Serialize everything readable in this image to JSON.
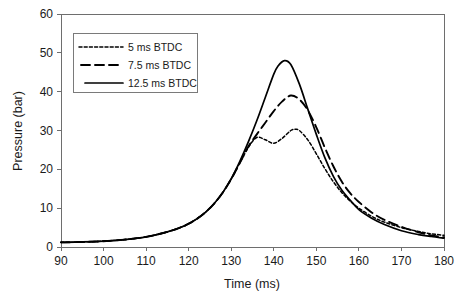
{
  "chart_data": {
    "type": "line",
    "title": "",
    "xlabel": "Time (ms)",
    "ylabel": "Pressure (bar)",
    "xlim": [
      90,
      180
    ],
    "ylim": [
      0,
      60
    ],
    "xticks": [
      90,
      100,
      110,
      120,
      130,
      140,
      150,
      160,
      170,
      180
    ],
    "yticks": [
      0,
      10,
      20,
      30,
      40,
      50,
      60
    ],
    "grid": false,
    "legend_position": "upper-left",
    "series": [
      {
        "name": "5 ms BTDC",
        "style": "dotted",
        "color": "#000000",
        "x": [
          90,
          95,
          100,
          105,
          110,
          115,
          118,
          120,
          122,
          124,
          126,
          128,
          130,
          132,
          134,
          136,
          138,
          140,
          142,
          144,
          145,
          146,
          148,
          150,
          152,
          154,
          156,
          158,
          160,
          163,
          166,
          170,
          174,
          177,
          180
        ],
        "y": [
          1.2,
          1.3,
          1.5,
          1.9,
          2.6,
          3.9,
          5.0,
          6.0,
          7.3,
          9.0,
          11.2,
          14.0,
          17.5,
          21.6,
          25.6,
          28.2,
          27.6,
          26.7,
          28.0,
          30.0,
          30.3,
          30.0,
          27.6,
          24.0,
          20.2,
          16.8,
          14.0,
          11.8,
          10.0,
          7.9,
          6.4,
          5.0,
          4.0,
          3.4,
          3.0
        ]
      },
      {
        "name": "7.5 ms BTDC",
        "style": "dashed",
        "color": "#000000",
        "x": [
          90,
          95,
          100,
          105,
          110,
          115,
          118,
          120,
          122,
          124,
          126,
          128,
          130,
          132,
          134,
          136,
          138,
          140,
          142,
          144,
          146,
          148,
          150,
          152,
          154,
          156,
          158,
          160,
          163,
          166,
          170,
          174,
          177,
          180
        ],
        "y": [
          1.2,
          1.3,
          1.5,
          1.9,
          2.6,
          3.9,
          5.0,
          6.0,
          7.3,
          9.0,
          11.2,
          14.0,
          17.5,
          21.6,
          25.8,
          29.0,
          32.0,
          35.0,
          37.5,
          39.0,
          38.0,
          35.2,
          30.8,
          25.6,
          20.8,
          16.8,
          13.8,
          11.6,
          8.9,
          7.0,
          5.2,
          3.8,
          3.0,
          2.5
        ]
      },
      {
        "name": "12.5 ms BTDC",
        "style": "solid",
        "color": "#000000",
        "x": [
          90,
          95,
          100,
          105,
          110,
          115,
          118,
          120,
          122,
          124,
          126,
          128,
          130,
          132,
          134,
          136,
          138,
          140,
          141,
          142.5,
          144,
          146,
          148,
          150,
          152,
          154,
          156,
          158,
          160,
          163,
          166,
          170,
          174,
          177,
          180
        ],
        "y": [
          1.2,
          1.3,
          1.5,
          1.9,
          2.6,
          3.9,
          5.0,
          6.0,
          7.3,
          9.0,
          11.2,
          14.0,
          17.6,
          22.0,
          27.0,
          32.5,
          38.5,
          44.5,
          46.6,
          48.0,
          47.0,
          42.0,
          35.5,
          29.0,
          23.0,
          18.2,
          14.6,
          12.0,
          9.6,
          7.4,
          5.8,
          4.2,
          3.2,
          2.7,
          2.3
        ]
      }
    ]
  },
  "legend": {
    "entries": [
      {
        "label": "5 ms BTDC"
      },
      {
        "label": "7.5 ms BTDC"
      },
      {
        "label": "12.5 ms BTDC"
      }
    ]
  },
  "axes": {
    "x_title": "Time (ms)",
    "y_title": "Pressure (bar)"
  }
}
